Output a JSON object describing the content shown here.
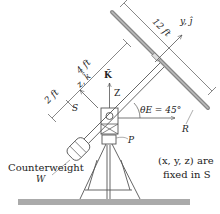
{
  "diagram": {
    "labels": {
      "dim_2ft": "2 ft",
      "dim_4ft": "4 ft",
      "dim_12ft": "12 ft",
      "axis_y": "y, ĵ",
      "axis_z_small": "z, k̂",
      "axis_K": "K̂",
      "axis_Z": "Z",
      "frame_S": "S",
      "angle": "θE = 45°",
      "point_R": "R",
      "point_P": "P",
      "counterweight": "Counterweight",
      "counterweight_symbol": "W",
      "note_line1": "(x, y, z) are",
      "note_line2": "fixed in S"
    },
    "values": {
      "theta_E_deg": 45,
      "arm_short_ft": 2,
      "arm_long_ft": 4,
      "panel_length_ft": 12
    },
    "colors": {
      "line": "#444444",
      "panel": "#9a9a9a",
      "ground": "#aaaaaa",
      "text": "#222222"
    }
  }
}
